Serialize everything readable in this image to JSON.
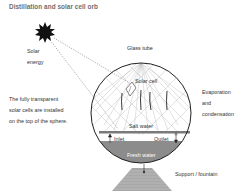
{
  "title": "Distillation and solar cell orb",
  "labels": {
    "solar_energy_line1": "Solar",
    "solar_energy_line2": "energy",
    "glass_tube": "Glass tube",
    "solar_cell": "Solar cell",
    "transparent_line1": "The fully transparent",
    "transparent_line2": "solar cells are installed",
    "transparent_line3": "on the top of the sphere.",
    "evaporation_line1": "Evaporation",
    "evaporation_line2": "and",
    "evaporation_line3": "condensation",
    "salt_water": "Salt water",
    "inlet": "Inlet",
    "outlet": "Outlet",
    "fresh_water": "Fresh water",
    "support": "Support / fountain"
  },
  "colors": {
    "sphere_outline": "#222222",
    "grid": "#b5b5b5",
    "fresh_water": "#8c8c8c",
    "salt_tray": "#7a7a7a",
    "support": "#a8a8a8",
    "sun": "#111111"
  }
}
